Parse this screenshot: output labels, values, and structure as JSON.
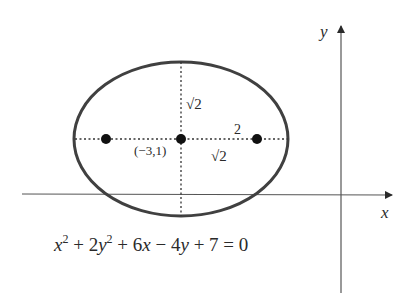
{
  "diagram": {
    "type": "ellipse-on-coordinate-axes",
    "axes": {
      "x_label": "x",
      "y_label": "y"
    },
    "ellipse": {
      "center_label": "(−3,1)",
      "center": [
        -3,
        1
      ],
      "semi_major_label": "2",
      "semi_minor_label": "√2",
      "focal_distance_label": "√2",
      "foci_count": 2
    },
    "equation": {
      "x2": "x",
      "sup2a": "2",
      "plus1": " + 2",
      "y2": "y",
      "sup2b": "2",
      "plus2": " + 6",
      "x": "x",
      "minus": " − 4",
      "y": "y",
      "rest": " + 7 = 0"
    },
    "colors": {
      "stroke": "#3a3a3a",
      "ellipse_stroke": "#404040",
      "dot": "#111111",
      "background": "#ffffff"
    }
  }
}
